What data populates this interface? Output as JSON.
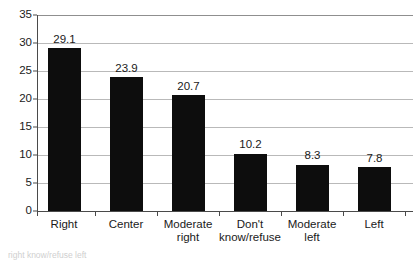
{
  "chart_data": {
    "type": "bar",
    "title": "",
    "subtitle": "",
    "xlabel": "",
    "ylabel": "",
    "categories": [
      "Right",
      "Center",
      "Moderate right",
      "Don't know/refuse",
      "Moderate left",
      "Left"
    ],
    "category_lines": [
      [
        "Right",
        ""
      ],
      [
        "Center",
        ""
      ],
      [
        "Moderate",
        "right"
      ],
      [
        "Don't",
        "know/refuse"
      ],
      [
        "Moderate",
        "left"
      ],
      [
        "Left",
        ""
      ]
    ],
    "values": [
      29.1,
      23.9,
      20.7,
      10.2,
      8.3,
      7.8
    ],
    "value_labels": [
      "29.1",
      "23.9",
      "20.7",
      "10.2",
      "8.3",
      "7.8"
    ],
    "ylim": [
      0,
      35
    ],
    "ytick_values": [
      0,
      5,
      10,
      15,
      20,
      25,
      30,
      35
    ],
    "ytick_labels": [
      "0",
      "5",
      "10",
      "15",
      "20",
      "25",
      "30",
      "35"
    ],
    "grid": true,
    "legend": "none",
    "bar_color": "#0d0d0d",
    "gridline_color": "#b9b9b9",
    "axis_color": "#4a4a4a",
    "background_color": "#ffffff"
  },
  "caption": {
    "text": "right     know/refuse     left"
  }
}
